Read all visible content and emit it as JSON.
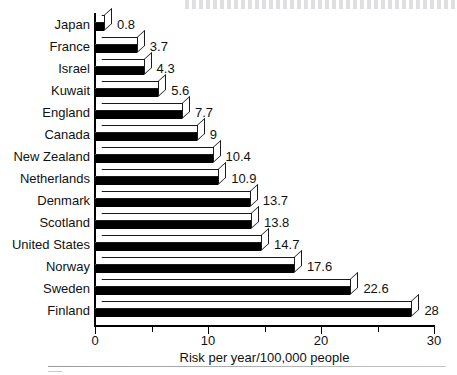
{
  "chart_data": {
    "type": "bar",
    "orientation": "horizontal",
    "title": "",
    "xlabel": "Risk per year/100,000 people",
    "ylabel": "",
    "xlim": [
      0,
      30
    ],
    "xticks": [
      0,
      10,
      20,
      30
    ],
    "xtick_labels": [
      "0",
      "10",
      "20",
      "30"
    ],
    "minor_xticks": [
      5,
      15,
      25
    ],
    "grid": false,
    "legend": false,
    "categories": [
      "Japan",
      "France",
      "Israel",
      "Kuwait",
      "England",
      "Canada",
      "New Zealand",
      "Netherlands",
      "Denmark",
      "Scotland",
      "United States",
      "Norway",
      "Sweden",
      "Finland"
    ],
    "values": [
      0.8,
      3.7,
      4.3,
      5.6,
      7.7,
      9,
      10.4,
      10.9,
      13.7,
      13.8,
      14.7,
      17.6,
      22.6,
      28
    ],
    "value_labels": [
      "0.8",
      "3.7",
      "4.3",
      "5.6",
      "7.7",
      "9",
      "10.4",
      "10.9",
      "13.7",
      "13.8",
      "14.7",
      "17.6",
      "22.6",
      "28"
    ],
    "bar_style": {
      "three_d": true,
      "front_face_color": "#000000",
      "top_face_color": "#ffffff",
      "edge_color": "#000000"
    }
  },
  "axis": {
    "x_title": "Risk per year/100,000 people",
    "tick_labels": [
      "0",
      "10",
      "20",
      "30"
    ]
  }
}
